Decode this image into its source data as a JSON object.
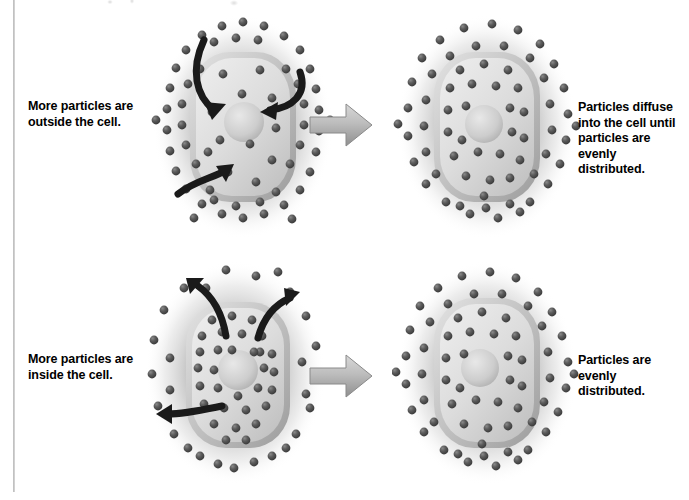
{
  "figure": {
    "type": "biology-diagram",
    "background_color": "#ffffff",
    "particle_color": "#4f4f4f",
    "membrane_color": "#b8b8b8",
    "cytoplasm_color": "#d6d6d6",
    "nucleus_color": "#cfcfcf",
    "arrow_color": "#1a1a1a",
    "block_arrow_color": "#b0b0b0"
  },
  "rows": [
    {
      "id": "row-diffusion-inward",
      "left_caption": "More particles are\noutside the cell.",
      "right_caption": "Particles diffuse\ninto the cell until\nparticles are evenly\ndistributed.",
      "before": {
        "name": "cell-more-particles-outside",
        "outside_density": "high",
        "inside_density": "low",
        "arrow_direction": "inward",
        "arrow_count": 3
      },
      "after": {
        "name": "cell-evenly-distributed",
        "outside_density": "medium",
        "inside_density": "medium",
        "arrow_direction": "none",
        "arrow_count": 0
      }
    },
    {
      "id": "row-diffusion-outward",
      "left_caption": "More particles are\ninside the cell.",
      "right_caption": "Particles are evenly\ndistributed.",
      "before": {
        "name": "cell-more-particles-inside",
        "outside_density": "low",
        "inside_density": "high",
        "arrow_direction": "outward",
        "arrow_count": 3
      },
      "after": {
        "name": "cell-evenly-distributed",
        "outside_density": "medium",
        "inside_density": "medium",
        "arrow_direction": "none",
        "arrow_count": 0
      }
    }
  ],
  "captions": {
    "top_left": "More particles are outside the cell.",
    "top_left_line1": "More particles are",
    "top_left_line2": "outside the cell.",
    "top_right_line1": "Particles diffuse",
    "top_right_line2": "into the cell until",
    "top_right_line3": "particles are evenly",
    "top_right_line4": "distributed.",
    "bottom_left_line1": "More particles are",
    "bottom_left_line2": "inside the cell.",
    "bottom_right_line1": "Particles are evenly",
    "bottom_right_line2": "distributed."
  },
  "icons": {
    "block_arrow": "right-block-arrow-icon",
    "flow_arrow": "curved-flow-arrow-icon",
    "particle": "particle-dot-icon",
    "nucleus": "nucleus-icon"
  }
}
